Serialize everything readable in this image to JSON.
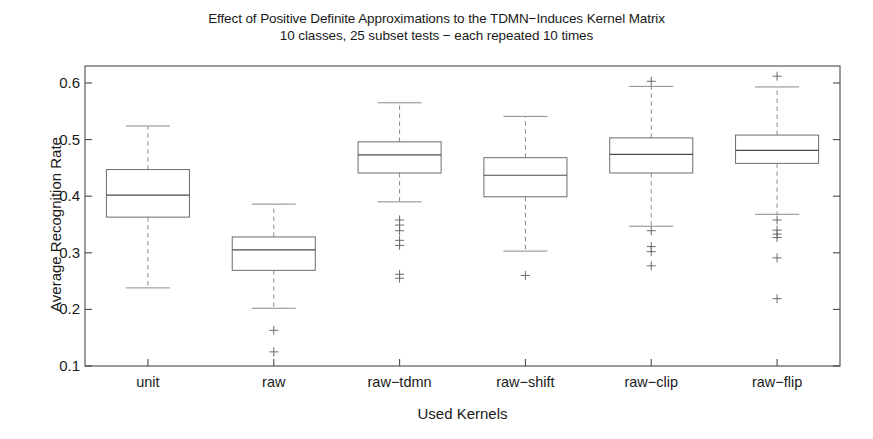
{
  "chart_data": {
    "type": "box",
    "title": "Effect of Positive Definite Approximations to the TDMN−Induces Kernel Matrix",
    "subtitle": "10 classes, 25 subset tests − each repeated 10 times",
    "xlabel": "Used Kernels",
    "ylabel": "Average Recognition Rate",
    "ylim": [
      0.1,
      0.63
    ],
    "ytick_labels": [
      "0.6",
      "0.5",
      "0.4",
      "0.3",
      "0.2",
      "0.1"
    ],
    "ytick_values": [
      0.6,
      0.5,
      0.4,
      0.3,
      0.2,
      0.1
    ],
    "grid": false,
    "legend": null,
    "categories": [
      "unit",
      "raw",
      "raw−tdmn",
      "raw−shift",
      "raw−clip",
      "raw−flip"
    ],
    "boxes": [
      {
        "category": "unit",
        "whisker_low": 0.238,
        "q1": 0.363,
        "median": 0.402,
        "q3": 0.447,
        "whisker_high": 0.524,
        "outliers": []
      },
      {
        "category": "raw",
        "whisker_low": 0.202,
        "q1": 0.269,
        "median": 0.305,
        "q3": 0.328,
        "whisker_high": 0.386,
        "outliers": [
          0.163,
          0.125
        ]
      },
      {
        "category": "raw−tdmn",
        "whisker_low": 0.39,
        "q1": 0.441,
        "median": 0.473,
        "q3": 0.496,
        "whisker_high": 0.565,
        "outliers": [
          0.358,
          0.349,
          0.339,
          0.322,
          0.313,
          0.262,
          0.255
        ]
      },
      {
        "category": "raw−shift",
        "whisker_low": 0.303,
        "q1": 0.399,
        "median": 0.437,
        "q3": 0.468,
        "whisker_high": 0.541,
        "outliers": [
          0.26
        ]
      },
      {
        "category": "raw−clip",
        "whisker_low": 0.347,
        "q1": 0.441,
        "median": 0.474,
        "q3": 0.503,
        "whisker_high": 0.594,
        "outliers": [
          0.603,
          0.339,
          0.311,
          0.302,
          0.277
        ]
      },
      {
        "category": "raw−flip",
        "whisker_low": 0.368,
        "q1": 0.458,
        "median": 0.481,
        "q3": 0.508,
        "whisker_high": 0.593,
        "outliers": [
          0.612,
          0.358,
          0.34,
          0.333,
          0.327,
          0.291,
          0.219
        ]
      }
    ]
  },
  "style": {
    "axis_color": "#4a4a4a",
    "box_color": "#6b6b6b",
    "whisker_color": "#8a8a8a",
    "background": "#ffffff"
  }
}
